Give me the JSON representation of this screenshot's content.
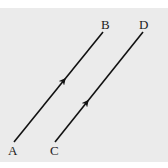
{
  "diagram": {
    "title": "",
    "background": "#ebebeb",
    "line_color": "#111111",
    "segments": [
      {
        "id": "AB",
        "from": {
          "label": "A",
          "x": 14,
          "y": 142
        },
        "to": {
          "label": "B",
          "x": 103,
          "y": 32
        },
        "arrow_at": {
          "x": 63,
          "y": 80
        }
      },
      {
        "id": "CD",
        "from": {
          "label": "C",
          "x": 55,
          "y": 142
        },
        "to": {
          "label": "D",
          "x": 143,
          "y": 32
        },
        "arrow_at": {
          "x": 86,
          "y": 103
        }
      }
    ],
    "labels": {
      "A": "A",
      "B": "B",
      "C": "C",
      "D": "D"
    }
  }
}
